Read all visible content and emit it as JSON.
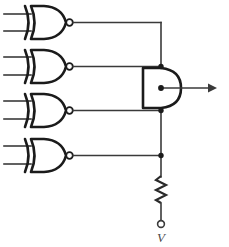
{
  "diagram": {
    "type": "logic-circuit-schematic",
    "background_color": "#ffffff",
    "line_color": "#3a3a3a",
    "gate_outline_color": "#1b1b1b"
  },
  "gates": [
    {
      "id": "gate-1",
      "type": "XNOR",
      "label": "",
      "inputs": [
        "",
        ""
      ],
      "output_bubble": true,
      "geometry": {
        "x": 22,
        "y": 6,
        "width": 46,
        "height": 33,
        "output_x": 70,
        "output_y": 22
      }
    },
    {
      "id": "gate-2",
      "type": "XNOR",
      "label": "",
      "inputs": [
        "",
        ""
      ],
      "output_bubble": true,
      "geometry": {
        "x": 22,
        "y": 50,
        "width": 46,
        "height": 33,
        "output_x": 70,
        "output_y": 66
      }
    },
    {
      "id": "gate-3",
      "type": "XNOR",
      "label": "",
      "inputs": [
        "",
        ""
      ],
      "output_bubble": true,
      "geometry": {
        "x": 22,
        "y": 94,
        "width": 46,
        "height": 33,
        "output_x": 70,
        "output_y": 110
      }
    },
    {
      "id": "gate-4",
      "type": "XNOR",
      "label": "",
      "inputs": [
        "",
        ""
      ],
      "output_bubble": true,
      "geometry": {
        "x": 22,
        "y": 139,
        "width": 46,
        "height": 33,
        "output_x": 70,
        "output_y": 155
      }
    }
  ],
  "and_gate": {
    "id": "and-gate",
    "type": "AND",
    "label": "",
    "geometry": {
      "x": 143,
      "y": 68,
      "width": 38,
      "height": 40
    }
  },
  "bus": {
    "id": "wired-and-bus",
    "orientation": "vertical",
    "x": 161,
    "y_top": 22,
    "y_bottom": 176,
    "junction_points": [
      66,
      88,
      110,
      155
    ]
  },
  "resistor": {
    "id": "pull-up-resistor",
    "label": "",
    "orientation": "vertical",
    "geometry": {
      "x": 161,
      "y_top": 176,
      "y_bottom": 202
    }
  },
  "supply_terminal": {
    "id": "supply-terminal",
    "label": "V",
    "geometry": {
      "cx": 161,
      "cy": 224,
      "r": 3.4
    }
  },
  "output_node": {
    "id": "circuit-output",
    "label": "",
    "geometry": {
      "x_start": 161,
      "x_end": 214,
      "y": 88
    }
  },
  "icons": {
    "xnor_gate": "xnor-gate-icon",
    "and_gate": "and-gate-icon",
    "resistor": "resistor-icon",
    "junction": "junction-dot-icon",
    "terminal": "open-terminal-icon",
    "arrow": "arrow-right-icon"
  }
}
